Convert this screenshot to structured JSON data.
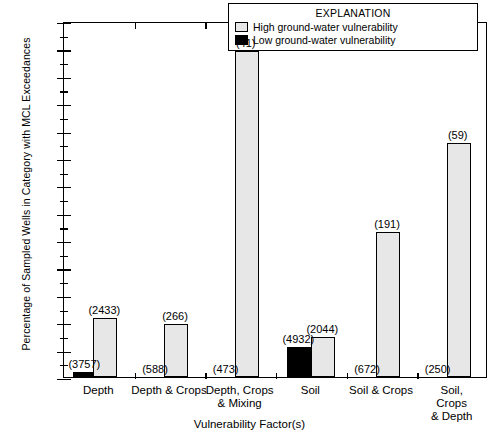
{
  "chart_data": {
    "type": "bar",
    "title": "",
    "xlabel": "Vulnerability Factor(s)",
    "ylabel": "Percentage of Sampled Wells in Category with MCL Exceedances",
    "ylim": [
      0,
      2.6
    ],
    "ytick_step": 0.2,
    "ytick_labels": [
      "0",
      "0.2",
      "0.4",
      "0.6",
      "0.8",
      "1.0",
      "1.2",
      "1.4",
      "1.6",
      "1.8",
      "2.0",
      "2.2",
      "2.4",
      "2.6"
    ],
    "grid": false,
    "legend_position": "top-right",
    "legend_title": "EXPLANATION",
    "categories": [
      "Depth",
      "Depth & Crops",
      "Depth, Crops\n& Mixing",
      "Soil",
      "Soil & Crops",
      "Soil, Crops\n& Depth"
    ],
    "series": [
      {
        "name": "Low ground-water vulnerability",
        "color": "#000000",
        "values": [
          0.04,
          null,
          null,
          0.22,
          null,
          null
        ],
        "counts": [
          "(3757)",
          "(588)",
          "(473)",
          "(4932)",
          "(672)",
          "(250)"
        ]
      },
      {
        "name": "High ground-water vulnerability",
        "color": "#e7e7e7",
        "values": [
          0.43,
          0.39,
          2.38,
          0.29,
          1.06,
          1.71
        ],
        "counts": [
          "(2433)",
          "(266)",
          "(41)",
          "(2044)",
          "(191)",
          "(59)"
        ]
      }
    ]
  },
  "legend": {
    "title": "EXPLANATION",
    "items": [
      {
        "label": "High ground-water vulnerability",
        "swatch": "high"
      },
      {
        "label": "Low ground-water vulnerability",
        "swatch": "low"
      }
    ]
  },
  "axes": {
    "x_title": "Vulnerability Factor(s)",
    "y_title": "Percentage of Sampled Wells in Category with MCL Exceedances"
  }
}
